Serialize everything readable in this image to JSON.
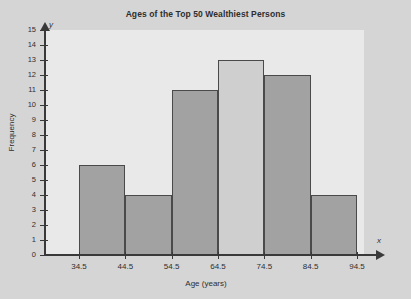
{
  "chart_data": {
    "type": "bar",
    "title": "Ages of the Top 50 Wealthiest Persons",
    "xlabel": "Age (years)",
    "ylabel": "Frequency",
    "x_axis_symbol": "x",
    "y_axis_symbol": "y",
    "categories": [
      "34.5-44.5",
      "44.5-54.5",
      "54.5-64.5",
      "64.5-74.5",
      "74.5-84.5",
      "84.5-94.5"
    ],
    "values": [
      6,
      4,
      11,
      13,
      12,
      4
    ],
    "bin_edges": [
      34.5,
      44.5,
      54.5,
      64.5,
      74.5,
      84.5,
      94.5
    ],
    "bin_width": 10,
    "x_tick_labels": [
      "34.5",
      "44.5",
      "54.5",
      "64.5",
      "74.5",
      "84.5",
      "94.5"
    ],
    "y_tick_labels": [
      "0",
      "1",
      "2",
      "3",
      "4",
      "5",
      "6",
      "7",
      "8",
      "9",
      "10",
      "11",
      "12",
      "13",
      "14",
      "15"
    ],
    "ylim": [
      0,
      15
    ],
    "xlim": [
      34.5,
      94.5
    ],
    "grid": false,
    "legend": null,
    "bar_colors": [
      "#a2a2a2",
      "#a2a2a2",
      "#a2a2a2",
      "#cfcfcf",
      "#a2a2a2",
      "#a2a2a2"
    ],
    "highlighted_bin_index": 3,
    "total_frequency": 50
  },
  "style": {
    "page_background": "#d5d5d6",
    "plot_background": "#e9e9e9",
    "axis_color": "#39393a",
    "bar_fill": "#a2a2a2",
    "bar_fill_light": "#cfcfcf",
    "bar_border": "#4a4a4a",
    "text_color": "#2e2e2e"
  }
}
